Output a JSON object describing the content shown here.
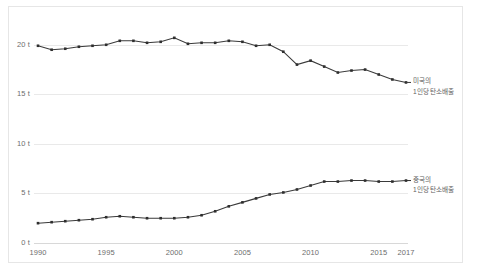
{
  "chart_data": {
    "type": "line",
    "title": "",
    "xlabel": "",
    "ylabel": "",
    "x": [
      1990,
      1991,
      1992,
      1993,
      1994,
      1995,
      1996,
      1997,
      1998,
      1999,
      2000,
      2001,
      2002,
      2003,
      2004,
      2005,
      2006,
      2007,
      2008,
      2009,
      2010,
      2011,
      2012,
      2013,
      2014,
      2015,
      2016,
      2017
    ],
    "xlim": [
      1990,
      2017
    ],
    "ylim": [
      0,
      22.5
    ],
    "xticks": [
      "1990",
      "1995",
      "2000",
      "2005",
      "2010",
      "2015",
      "2017"
    ],
    "xtick_values": [
      1990,
      1995,
      2000,
      2005,
      2010,
      2015,
      2017
    ],
    "yticks": [
      "0 t",
      "5 t",
      "10 t",
      "15 t",
      "20 t"
    ],
    "ytick_values": [
      0,
      5,
      10,
      15,
      20
    ],
    "grid": true,
    "legend_position": "right-inline",
    "series": [
      {
        "name": "미국의 1인당 탄소배출",
        "label_line1": "미국의",
        "label_line2": "1인당 탄소배출",
        "color": "#3a3a3a",
        "values": [
          19.9,
          19.5,
          19.6,
          19.8,
          19.9,
          20.0,
          20.4,
          20.4,
          20.2,
          20.3,
          20.7,
          20.1,
          20.2,
          20.2,
          20.4,
          20.3,
          19.9,
          20.0,
          19.3,
          18.0,
          18.4,
          17.8,
          17.2,
          17.4,
          17.5,
          17.0,
          16.5,
          16.2
        ]
      },
      {
        "name": "중국의 1인당 탄소배출",
        "label_line1": "중국의",
        "label_line2": "1인당 탄소배출",
        "color": "#2e2e2e",
        "values": [
          2.0,
          2.1,
          2.2,
          2.3,
          2.4,
          2.6,
          2.7,
          2.6,
          2.5,
          2.5,
          2.5,
          2.6,
          2.8,
          3.2,
          3.7,
          4.1,
          4.5,
          4.9,
          5.1,
          5.4,
          5.8,
          6.2,
          6.2,
          6.3,
          6.3,
          6.2,
          6.2,
          6.3
        ]
      }
    ]
  }
}
